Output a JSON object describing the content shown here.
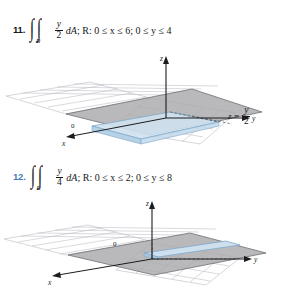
{
  "page": {
    "background": "#ffffff",
    "accent_color": "#3f7fb5",
    "text_color": "#17171a"
  },
  "problems": [
    {
      "number": "11.",
      "number_style": "plain",
      "integral_symbol": "∫",
      "integral_subscript": "R",
      "integrand": {
        "numerator": "y",
        "denominator": "2"
      },
      "differential": "dA",
      "region_text": "; R: 0 ≤ x ≤ 6; 0 ≤ y ≤ 4",
      "figure": {
        "plane_equation_lhs": "z",
        "equals": "=",
        "plane_numerator": "y",
        "plane_denominator": "2",
        "axis_z": "z",
        "axis_y": "y",
        "axis_x": "x",
        "origin_label": "0",
        "surface_color": "#a9aaac",
        "region_color": "#cfe2f0",
        "grid_color": "#b9bcc2"
      }
    },
    {
      "number": "12.",
      "number_style": "accent",
      "integral_symbol": "∫",
      "integral_subscript": "R",
      "integrand": {
        "numerator": "y",
        "denominator": "4"
      },
      "differential": "dA",
      "region_text": "; R: 0 ≤ x ≤ 2; 0 ≤ y ≤ 8",
      "figure": {
        "plane_equation_lhs": "z",
        "equals": "=",
        "plane_numerator": "y",
        "plane_denominator": "4",
        "axis_z": "z",
        "axis_y": "y",
        "axis_x": "x",
        "origin_label": "0",
        "surface_color": "#a9aaac",
        "region_color": "#cfe2f0",
        "grid_color": "#b9bcc2"
      }
    }
  ]
}
